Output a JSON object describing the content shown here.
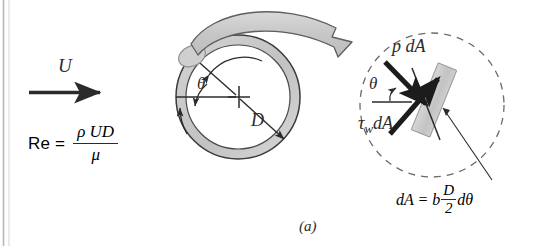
{
  "figure": {
    "caption": "(a)",
    "background": "#ffffff",
    "ink_color": "#2b2b2b",
    "shade_color": "#c9c9c9"
  },
  "freestream": {
    "velocity_label": "U",
    "arrow": "right-arrow"
  },
  "reynolds": {
    "lhs": "Re =",
    "numerator": "ρ UD",
    "denominator": "μ"
  },
  "cylinder": {
    "angle_label": "θ",
    "diameter_label": "D",
    "center_marker": "cross"
  },
  "detail": {
    "pressure_force_label": "p dA",
    "shear_force_label_tau": "τ",
    "shear_force_label_sub": "w",
    "shear_force_label_rest": "dA",
    "angle_label": "θ",
    "boundary": "dashed-circle"
  },
  "area_element": {
    "lhs": "dA  =  b",
    "numerator": "D",
    "denominator": "2",
    "rhs": "dθ"
  }
}
